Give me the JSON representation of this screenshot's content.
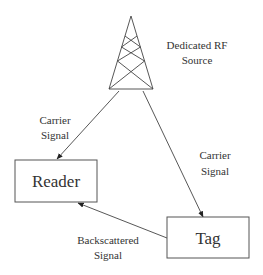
{
  "diagram": {
    "type": "rfid-backscatter-diagram",
    "nodes": {
      "source": {
        "label_line1": "Dedicated RF",
        "label_line2": "Source",
        "icon": "antenna-tower-icon"
      },
      "reader": {
        "label": "Reader"
      },
      "tag": {
        "label": "Tag"
      }
    },
    "edges": [
      {
        "from": "source",
        "to": "reader",
        "label_line1": "Carrier",
        "label_line2": "Signal"
      },
      {
        "from": "source",
        "to": "tag",
        "label_line1": "Carrier",
        "label_line2": "Signal"
      },
      {
        "from": "tag",
        "to": "reader",
        "label_line1": "Backscattered",
        "label_line2": "Signal"
      }
    ],
    "colors": {
      "line": "#444444",
      "text": "#333333",
      "background": "#ffffff"
    }
  }
}
